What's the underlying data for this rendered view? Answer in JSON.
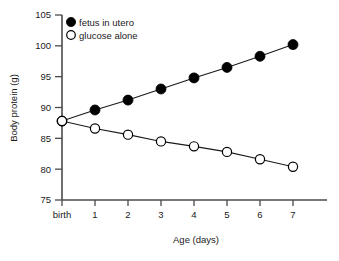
{
  "chart_data": {
    "type": "line",
    "title": "",
    "xlabel": "Age (days)",
    "ylabel": "Body protein (g)",
    "x": [
      0,
      1,
      2,
      3,
      4,
      5,
      6,
      7
    ],
    "xtick_labels": [
      "birth",
      "1",
      "2",
      "3",
      "4",
      "5",
      "6",
      "7"
    ],
    "ytick_labels": [
      "75",
      "80",
      "85",
      "90",
      "95",
      "100",
      "105"
    ],
    "yticks": [
      75,
      80,
      85,
      90,
      95,
      100,
      105
    ],
    "ylim": [
      75,
      105
    ],
    "xlim": [
      0,
      7
    ],
    "grid": false,
    "legend_position": "top-left",
    "series": [
      {
        "name": "fetus in utero",
        "marker": "filled-circle",
        "color": "#000000",
        "values": [
          87.8,
          89.6,
          91.2,
          93.0,
          94.8,
          96.5,
          98.3,
          100.2
        ]
      },
      {
        "name": "glucose alone",
        "marker": "open-circle",
        "color": "#ffffff",
        "values": [
          87.8,
          86.6,
          85.6,
          84.5,
          83.7,
          82.8,
          81.6,
          80.4
        ]
      }
    ]
  },
  "legend": {
    "items": [
      {
        "label": "fetus in utero"
      },
      {
        "label": "glucose alone"
      }
    ]
  },
  "axes": {
    "y_title": "Body protein (g)",
    "x_title": "Age (days)"
  },
  "colors": {
    "axis": "#4a4a4a",
    "line": "#1a1a1a",
    "filled_marker": "#000000",
    "open_marker_fill": "#ffffff",
    "text": "#1a1a1a",
    "background": "#ffffff"
  }
}
